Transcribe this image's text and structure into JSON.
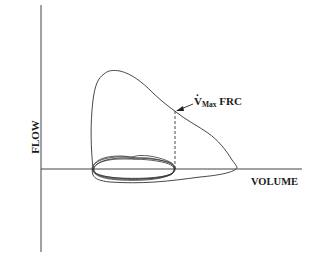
{
  "diagram": {
    "type": "flow-volume loop",
    "axes": {
      "y_label": "FLOW",
      "x_label": "VOLUME"
    },
    "annotation": {
      "symbol": "V",
      "subscript": "Max",
      "suffix": " FRC",
      "description": "Maximal flow at functional residual capacity, marked by dashed vertical line and arrow"
    },
    "elements": [
      "forced expiratory flow-volume curve (large loop)",
      "tidal breathing loops (small overlapping ellipses near origin)",
      "dashed vertical line at FRC volume",
      "arrow pointing to curve at FRC"
    ],
    "colors": {
      "line": "#333333",
      "background": "#ffffff"
    }
  }
}
